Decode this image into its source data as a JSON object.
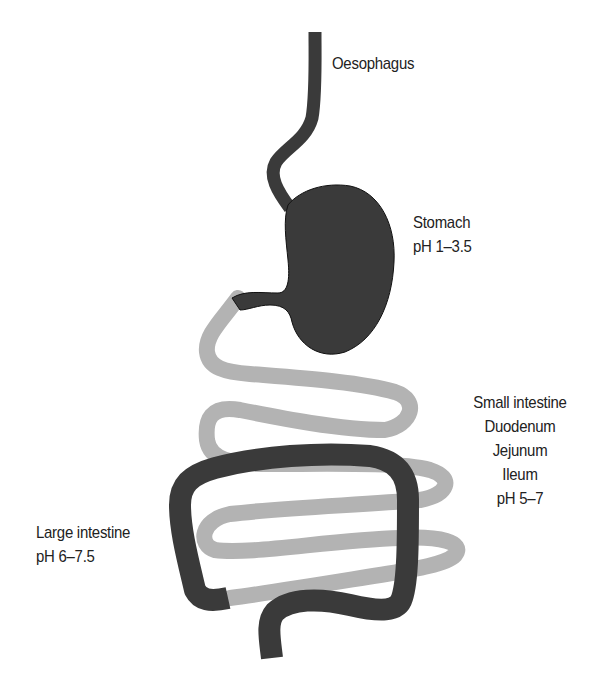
{
  "figure": {
    "type": "digestive-tract-ph-diagram",
    "colors": {
      "dark_segments": "#3a3a3a",
      "small_intestine": "#b3b3b3",
      "outline": "#111111",
      "text": "#222222",
      "background": "#ffffff"
    }
  },
  "labels": {
    "oesophagus": {
      "name": "Oesophagus"
    },
    "stomach": {
      "name": "Stomach",
      "ph": "pH 1–3.5"
    },
    "small_intestine": {
      "name": "Small intestine",
      "parts": [
        "Duodenum",
        "Jejunum",
        "Ileum"
      ],
      "ph": "pH 5–7"
    },
    "large_intestine": {
      "name": "Large intestine",
      "ph": "pH 6–7.5"
    }
  }
}
